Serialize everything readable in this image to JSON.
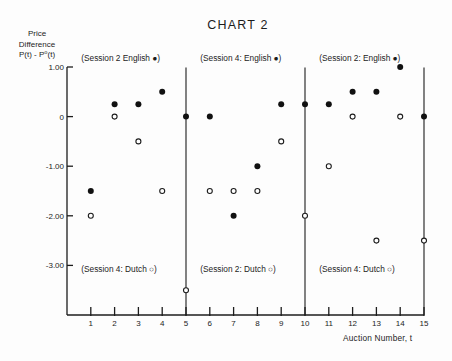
{
  "chart_data": {
    "type": "scatter",
    "title": "CHART 2",
    "ylabel_lines": [
      "Price",
      "Difference",
      "P(t) - P⁰(t)"
    ],
    "xlabel": "Auction Number, t",
    "x": [
      1,
      2,
      3,
      4,
      5,
      6,
      7,
      8,
      9,
      10,
      11,
      12,
      13,
      14,
      15
    ],
    "xlim": [
      0,
      15
    ],
    "ylim": [
      -4,
      1
    ],
    "xticks": [
      1,
      2,
      3,
      4,
      5,
      6,
      7,
      8,
      9,
      10,
      11,
      12,
      13,
      14,
      15
    ],
    "xtick_labels": [
      "1",
      "2",
      "3",
      "4",
      "5",
      "6",
      "7",
      "8",
      "9",
      "10",
      "11",
      "12",
      "13",
      "14",
      "15"
    ],
    "yticks": [
      1,
      0,
      -1,
      -2,
      -3
    ],
    "ytick_labels": [
      "1.00",
      "0",
      "-1.00",
      "-2.00",
      "-3.00"
    ],
    "grid": false,
    "session_dividers": [
      5,
      10,
      15
    ],
    "series": [
      {
        "name": "English",
        "marker": "filled-circle",
        "values": [
          -1.5,
          0.25,
          0.25,
          0.5,
          0,
          0,
          -2.0,
          -1.0,
          0.25,
          0.25,
          0.25,
          0.5,
          0.5,
          1.0,
          0
        ]
      },
      {
        "name": "Dutch",
        "marker": "open-circle",
        "values": [
          -2.0,
          0,
          -0.5,
          -1.5,
          -3.5,
          -1.5,
          -1.5,
          -1.5,
          -0.5,
          -2.0,
          -1.0,
          0,
          -2.5,
          0,
          -2.5
        ]
      }
    ],
    "annotations": [
      {
        "text": "(Session 2  English ●)",
        "auctions": [
          1,
          5
        ],
        "placement": "top"
      },
      {
        "text": "(Session 4: English ●)",
        "auctions": [
          6,
          10
        ],
        "placement": "top"
      },
      {
        "text": "(Session 2: English ●)",
        "auctions": [
          11,
          15
        ],
        "placement": "top"
      },
      {
        "text": "(Session 4: Dutch ○)",
        "auctions": [
          1,
          5
        ],
        "placement": "bottom"
      },
      {
        "text": "(Session 2: Dutch ○)",
        "auctions": [
          6,
          10
        ],
        "placement": "bottom"
      },
      {
        "text": "(Session 4: Dutch ○)",
        "auctions": [
          11,
          15
        ],
        "placement": "bottom"
      }
    ],
    "ink_color": "#1c1c1c"
  }
}
